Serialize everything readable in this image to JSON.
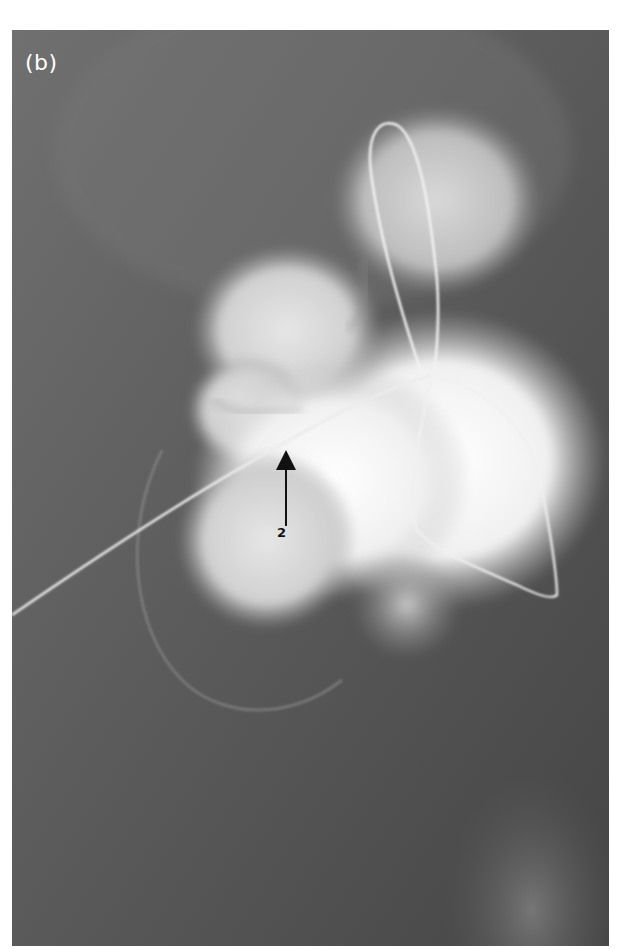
{
  "figure": {
    "panel_label": "(b)",
    "annotations": [
      {
        "id": "arrow-2",
        "label": "2",
        "direction": "up",
        "color": "#000000"
      }
    ],
    "image_type": "grayscale radiograph",
    "colors": {
      "background_page": "#ffffff",
      "image_background_dark": "#4a4a4a",
      "image_background_mid": "#6e6e6e",
      "contrast_bright": "#f4f4f4",
      "wire": "#e8e8e8"
    }
  }
}
